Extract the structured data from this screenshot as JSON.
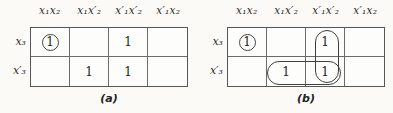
{
  "colors": {
    "background": "#fbfaf7",
    "grid_border": "#565656",
    "inner_lines": "#6b6b6b",
    "text": "#1f1f1f",
    "ring_border": "#444444"
  },
  "maps": [
    {
      "caption": "(a)",
      "col_headers": [
        "x₁x₂",
        "x₁x′₂",
        "x′₁x′₂",
        "x′₁x₂"
      ],
      "row_headers": [
        "x₃",
        "x′₃"
      ],
      "rows": [
        [
          {
            "v": "1",
            "ring": true
          },
          {
            "v": ""
          },
          {
            "v": "1"
          },
          {
            "v": ""
          }
        ],
        [
          {
            "v": ""
          },
          {
            "v": "1"
          },
          {
            "v": "1"
          },
          {
            "v": ""
          }
        ]
      ],
      "groups": []
    },
    {
      "caption": "(b)",
      "col_headers": [
        "x₁x₂",
        "x₁x′₂",
        "x′₁x′₂",
        "x′₁x₂"
      ],
      "row_headers": [
        "x₃",
        "x′₃"
      ],
      "rows": [
        [
          {
            "v": "1",
            "ring": true
          },
          {
            "v": ""
          },
          {
            "v": "1"
          },
          {
            "v": ""
          }
        ],
        [
          {
            "v": ""
          },
          {
            "v": "1"
          },
          {
            "v": "1"
          },
          {
            "v": ""
          }
        ]
      ],
      "groups": [
        {
          "shape": "vertical-oval",
          "cells": [
            "x₃·x′₁x′₂",
            "x′₃·x′₁x′₂"
          ]
        },
        {
          "shape": "horizontal-oval",
          "cells": [
            "x′₃·x₁x′₂",
            "x′₃·x′₁x′₂"
          ]
        }
      ]
    }
  ]
}
